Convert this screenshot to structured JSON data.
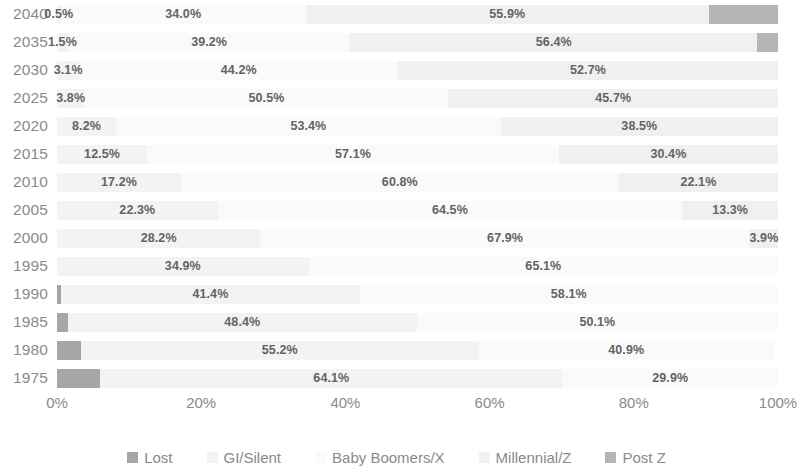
{
  "chart_data": {
    "type": "bar",
    "subtype": "stacked-horizontal-100pct",
    "title": "",
    "xlabel": "",
    "ylabel": "",
    "xlim": [
      0,
      100
    ],
    "grid": false,
    "legend_position": "bottom",
    "orientation": "horizontal",
    "stacked": true,
    "categories": [
      "2040",
      "2035",
      "2030",
      "2025",
      "2020",
      "2015",
      "2010",
      "2005",
      "2000",
      "1995",
      "1990",
      "1985",
      "1980",
      "1975"
    ],
    "xticks": [
      "0%",
      "20%",
      "40%",
      "60%",
      "80%",
      "100%"
    ],
    "xtick_values": [
      0,
      20,
      40,
      60,
      80,
      100
    ],
    "series": [
      {
        "name": "Lost",
        "color": "#a6a6a6",
        "values": [
          0,
          0,
          0,
          0,
          0,
          0,
          0,
          0,
          0,
          0,
          0.6,
          1.5,
          3.3,
          6.0
        ],
        "labels": [
          "",
          "",
          "",
          "",
          "",
          "",
          "",
          "",
          "",
          "",
          "",
          "",
          "",
          ""
        ]
      },
      {
        "name": "GI/Silent",
        "color": "#f3f3f3",
        "values": [
          0.5,
          1.5,
          3.1,
          3.8,
          8.2,
          12.5,
          17.2,
          22.3,
          28.2,
          34.9,
          41.4,
          48.4,
          55.2,
          64.1
        ],
        "labels": [
          "0.5%",
          "1.5%",
          "3.1%",
          "3.8%",
          "8.2%",
          "12.5%",
          "17.2%",
          "22.3%",
          "28.2%",
          "34.9%",
          "41.4%",
          "48.4%",
          "55.2%",
          "64.1%"
        ]
      },
      {
        "name": "Baby Boomers/X",
        "color": "#fafafa",
        "values": [
          34.0,
          39.2,
          44.2,
          50.5,
          53.4,
          57.1,
          60.8,
          64.5,
          67.9,
          65.1,
          58.1,
          50.1,
          40.9,
          29.9
        ],
        "labels": [
          "34.0%",
          "39.2%",
          "44.2%",
          "50.5%",
          "53.4%",
          "57.1%",
          "60.8%",
          "64.5%",
          "67.9%",
          "65.1%",
          "58.1%",
          "50.1%",
          "40.9%",
          "29.9%"
        ]
      },
      {
        "name": "Millennial/Z",
        "color": "#f0f0f0",
        "values": [
          55.9,
          56.4,
          52.7,
          45.7,
          38.5,
          30.4,
          22.1,
          13.3,
          3.9,
          0,
          0,
          0,
          0,
          0
        ],
        "labels": [
          "55.9%",
          "56.4%",
          "52.7%",
          "45.7%",
          "38.5%",
          "30.4%",
          "22.1%",
          "13.3%",
          "3.9%",
          "",
          "",
          "",
          "",
          ""
        ]
      },
      {
        "name": "Post Z",
        "color": "#b5b5b5",
        "values": [
          9.6,
          2.9,
          0,
          0,
          0,
          0,
          0,
          0,
          0,
          0,
          0,
          0,
          0,
          0
        ],
        "labels": [
          "",
          "",
          "",
          "",
          "",
          "",
          "",
          "",
          "",
          "",
          "",
          "",
          "",
          ""
        ]
      }
    ]
  },
  "legend": {
    "items": [
      {
        "label": "Lost",
        "color": "#a6a6a6"
      },
      {
        "label": "GI/Silent",
        "color": "#f3f3f3"
      },
      {
        "label": "Baby Boomers/X",
        "color": "#fafafa"
      },
      {
        "label": "Millennial/Z",
        "color": "#f0f0f0"
      },
      {
        "label": "Post Z",
        "color": "#b5b5b5"
      }
    ]
  }
}
